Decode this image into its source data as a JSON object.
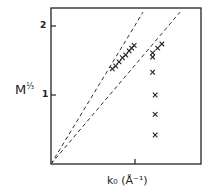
{
  "chart_data": {
    "type": "scatter",
    "title": "",
    "xlabel": "k₀ (Å⁻¹)",
    "ylabel": "M^1/3",
    "ylabel_main": "M",
    "ylabel_exp": "⅓",
    "xlim": [
      0,
      1.79
    ],
    "ylim": [
      0,
      2.26
    ],
    "yticks": [
      1,
      2
    ],
    "ytick_labels": [
      "1",
      "2"
    ],
    "xticks": [
      1
    ],
    "xtick_labels": [
      ""
    ],
    "grid": false,
    "legend": null,
    "marker": "x",
    "series": [
      {
        "name": "left-series",
        "points": [
          [
            0.73,
            1.38
          ],
          [
            0.77,
            1.42
          ],
          [
            0.81,
            1.48
          ],
          [
            0.85,
            1.54
          ],
          [
            0.89,
            1.58
          ],
          [
            0.93,
            1.64
          ],
          [
            0.96,
            1.68
          ],
          [
            0.99,
            1.72
          ]
        ]
      },
      {
        "name": "right-series",
        "points": [
          [
            1.32,
            1.74
          ],
          [
            1.27,
            1.68
          ],
          [
            1.21,
            1.61
          ],
          [
            1.21,
            1.55
          ],
          [
            1.21,
            1.33
          ],
          [
            1.24,
            1.0
          ],
          [
            1.24,
            0.72
          ],
          [
            1.24,
            0.42
          ]
        ]
      }
    ],
    "fit_lines": [
      {
        "name": "steep-dashed-line",
        "from": [
          0,
          0
        ],
        "to": [
          1.095,
          2.2
        ],
        "style": "dashed"
      },
      {
        "name": "shallow-dashed-line",
        "from": [
          0,
          0
        ],
        "to": [
          1.535,
          2.2
        ],
        "style": "dashed"
      }
    ]
  },
  "labels": {
    "y_main": "M",
    "y_exp": "⅓",
    "x": "k₀ (Å⁻¹)",
    "tick_2": "2",
    "tick_1": "1"
  }
}
